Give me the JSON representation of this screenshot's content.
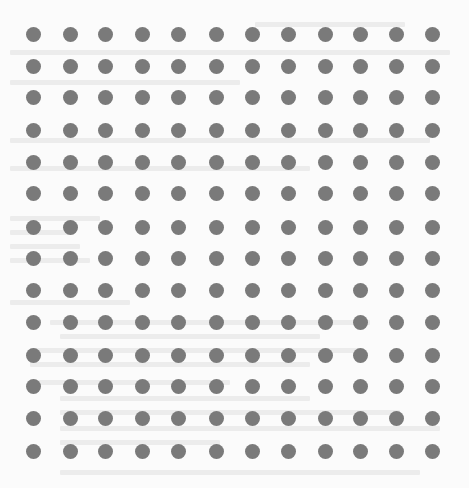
{
  "image": {
    "description": "Uniform grid of gray dots over a faint, illegible background document",
    "background_color": "#fbfbfb",
    "ghost_text_color": "#ececec"
  },
  "dot_grid": {
    "rows": 14,
    "columns": 12,
    "dot_color": "#7a7a7a",
    "total_dots": 168
  }
}
